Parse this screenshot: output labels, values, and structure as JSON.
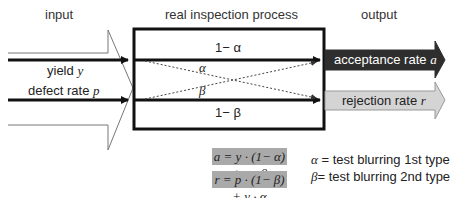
{
  "headers": {
    "input": "input",
    "process": "real inspection process",
    "output": "output"
  },
  "inputs": [
    {
      "label": "yield",
      "symbol": "y"
    },
    {
      "label": "defect rate",
      "symbol": "p"
    }
  ],
  "process": {
    "top_path": "1− α",
    "cross_alpha": "α",
    "cross_beta": "β",
    "bottom_path": "1− β"
  },
  "outputs": [
    {
      "label": "acceptance rate",
      "symbol": "a",
      "color": "#2e2e2e",
      "text_color": "#ffffff"
    },
    {
      "label": "rejection rate",
      "symbol": "r",
      "color": "#d4d4d4",
      "text_color": "#222222"
    }
  ],
  "formulas": {
    "acceptance": "a = y · (1− α) + p · β",
    "rejection": "r = p · (1− β) + y · α"
  },
  "legend": {
    "alpha": {
      "symbol": "α",
      "text": " = test blurring 1st type"
    },
    "beta": {
      "symbol": "β",
      "text": "= test blurring 2nd type"
    }
  },
  "colors": {
    "formula_bg": "#a9a9a9",
    "line": "#111111"
  }
}
